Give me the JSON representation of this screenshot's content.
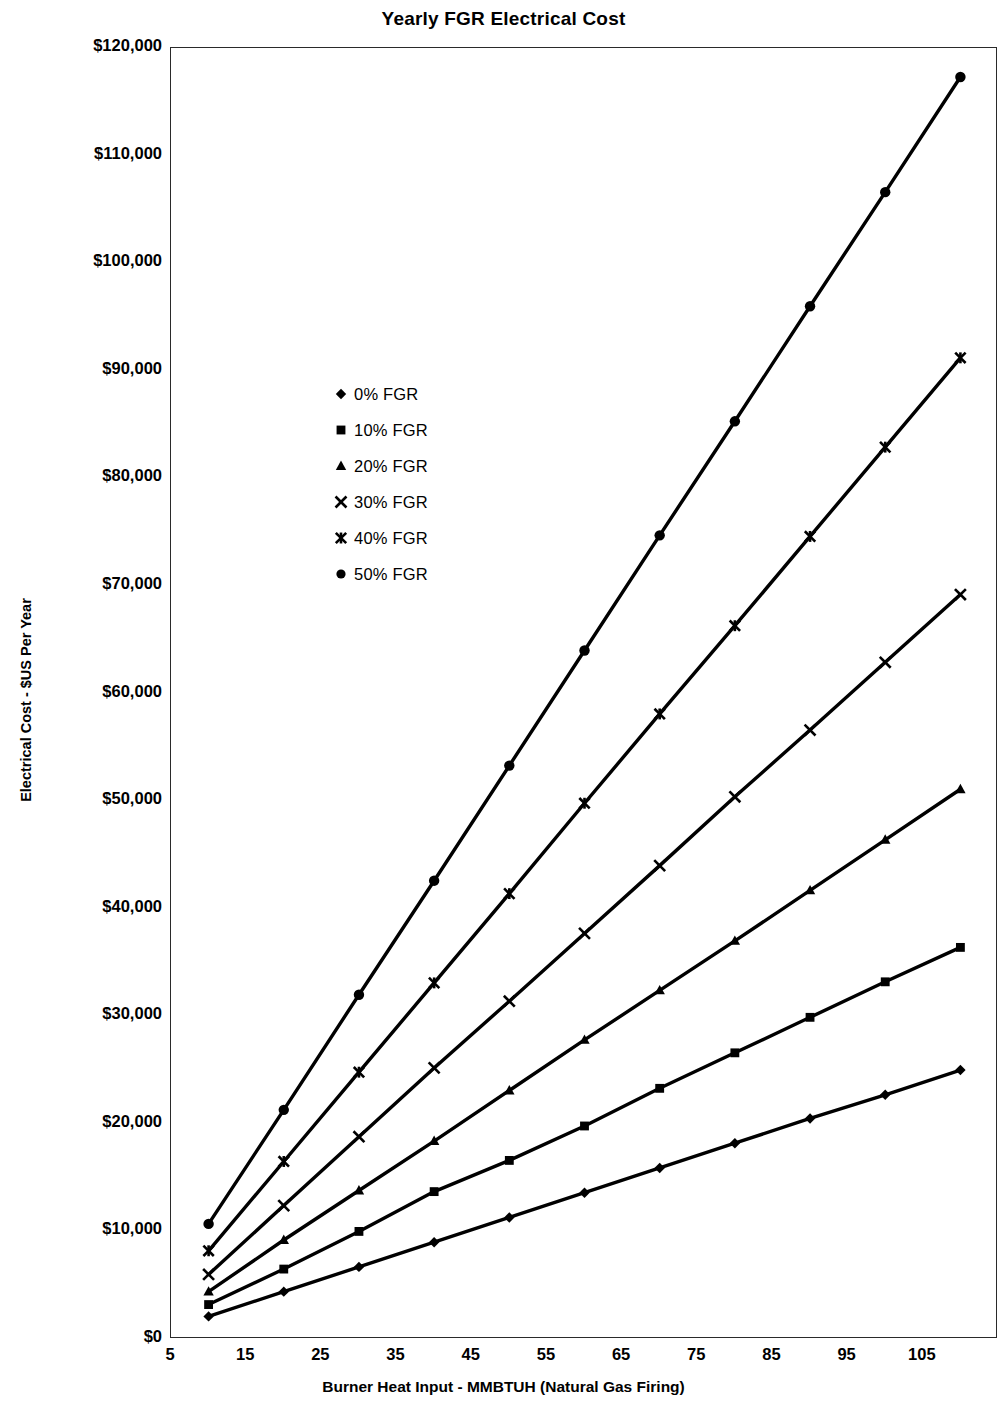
{
  "chart_data": {
    "type": "line",
    "title": "Yearly FGR Electrical Cost",
    "xlabel": "Burner Heat Input - MMBTUH (Natural Gas Firing)",
    "ylabel": "Electrical Cost - $US Per Year",
    "xlim": [
      5,
      115
    ],
    "ylim": [
      0,
      120000
    ],
    "grid": false,
    "legend_position": "inside-upper-left",
    "x_tick_labels": [
      "5",
      "15",
      "25",
      "35",
      "45",
      "55",
      "65",
      "75",
      "85",
      "95",
      "105"
    ],
    "x_ticks": [
      5,
      15,
      25,
      35,
      45,
      55,
      65,
      75,
      85,
      95,
      105
    ],
    "y_tick_labels": [
      "$0",
      "$10,000",
      "$20,000",
      "$30,000",
      "$40,000",
      "$50,000",
      "$60,000",
      "$70,000",
      "$80,000",
      "$90,000",
      "$100,000",
      "$110,000",
      "$120,000"
    ],
    "y_ticks": [
      0,
      10000,
      20000,
      30000,
      40000,
      50000,
      60000,
      70000,
      80000,
      90000,
      100000,
      110000,
      120000
    ],
    "x": [
      10,
      20,
      30,
      40,
      50,
      60,
      70,
      80,
      90,
      100,
      110
    ],
    "series": [
      {
        "name": "0% FGR",
        "marker": "diamond",
        "values": [
          2100,
          4400,
          6700,
          9000,
          11300,
          13600,
          15900,
          18200,
          20500,
          22700,
          25000
        ]
      },
      {
        "name": "10% FGR",
        "marker": "square",
        "values": [
          3200,
          6500,
          10000,
          13700,
          16600,
          19800,
          23300,
          26600,
          29900,
          33200,
          36400
        ]
      },
      {
        "name": "20% FGR",
        "marker": "triangle",
        "values": [
          4400,
          9200,
          13800,
          18400,
          23100,
          27800,
          32400,
          37000,
          41700,
          46400,
          51100
        ]
      },
      {
        "name": "30% FGR",
        "marker": "cross",
        "values": [
          6000,
          12400,
          18800,
          25200,
          31400,
          37700,
          44000,
          50400,
          56600,
          62900,
          69200
        ]
      },
      {
        "name": "40% FGR",
        "marker": "star",
        "values": [
          8200,
          16500,
          24800,
          33100,
          41400,
          49800,
          58100,
          66300,
          74600,
          82900,
          91200
        ]
      },
      {
        "name": "50% FGR",
        "marker": "circle",
        "values": [
          10700,
          21300,
          32000,
          42600,
          53300,
          64000,
          74700,
          85300,
          96000,
          106600,
          117300
        ]
      }
    ]
  },
  "legend": {
    "items": [
      {
        "label": "0% FGR",
        "marker": "diamond"
      },
      {
        "label": "10% FGR",
        "marker": "square"
      },
      {
        "label": "20% FGR",
        "marker": "triangle"
      },
      {
        "label": "30% FGR",
        "marker": "cross"
      },
      {
        "label": "40% FGR",
        "marker": "star"
      },
      {
        "label": "50% FGR",
        "marker": "circle"
      }
    ]
  }
}
